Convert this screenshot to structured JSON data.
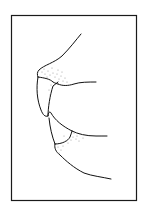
{
  "figure": {
    "frame": {
      "x": 11,
      "y": 15,
      "width": 126,
      "height": 186,
      "stroke": "#1a1a1a"
    },
    "stroke_color": "#111111",
    "stipple_color": "#8a8a8a",
    "background": "#ffffff"
  }
}
